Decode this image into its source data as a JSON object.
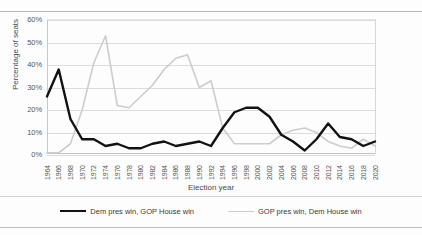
{
  "chart_data": {
    "type": "line",
    "title": "",
    "xlabel": "Election year",
    "ylabel": "Percentage of seats",
    "ylim": [
      0,
      60
    ],
    "ytick_labels": [
      "60%",
      "50%",
      "40%",
      "30%",
      "20%",
      "10%",
      "0%"
    ],
    "ytick_values": [
      60,
      50,
      40,
      30,
      20,
      10,
      0
    ],
    "grid": true,
    "legend_position": "bottom",
    "categories": [
      "1964",
      "1966",
      "1968",
      "1970",
      "1972",
      "1974",
      "1976",
      "1978",
      "1980",
      "1982",
      "1984",
      "1986",
      "1988",
      "1990",
      "1992",
      "1994",
      "1996",
      "1998",
      "2000",
      "2002",
      "2004",
      "2006",
      "2008",
      "2010",
      "2012",
      "2014",
      "2016",
      "2018",
      "2020"
    ],
    "series": [
      {
        "name": "Dem pres win, GOP House win",
        "color": "#121212",
        "width": 2.4,
        "values": [
          26,
          38,
          16,
          7,
          7,
          4,
          5,
          3,
          3,
          5,
          6,
          4,
          5,
          6,
          4,
          12,
          19,
          21,
          21,
          17,
          9,
          6,
          2,
          7,
          14,
          8,
          7,
          4,
          6
        ]
      },
      {
        "name": "GOP pres win, Dem House win",
        "color": "#cdcdcd",
        "width": 1.6,
        "values": [
          1,
          1,
          5,
          20,
          41,
          53,
          22,
          21,
          26,
          31,
          38,
          43,
          44.5,
          30,
          33,
          12,
          5,
          5,
          5,
          5,
          9,
          11,
          12,
          10,
          6,
          4,
          3,
          7,
          4
        ]
      }
    ]
  },
  "legend": {
    "items": [
      {
        "label": "Dem pres win, GOP House win"
      },
      {
        "label": "GOP pres win, Dem House win"
      }
    ]
  },
  "axes": {
    "x_title": "Election year",
    "y_title": "Percentage of seats"
  }
}
